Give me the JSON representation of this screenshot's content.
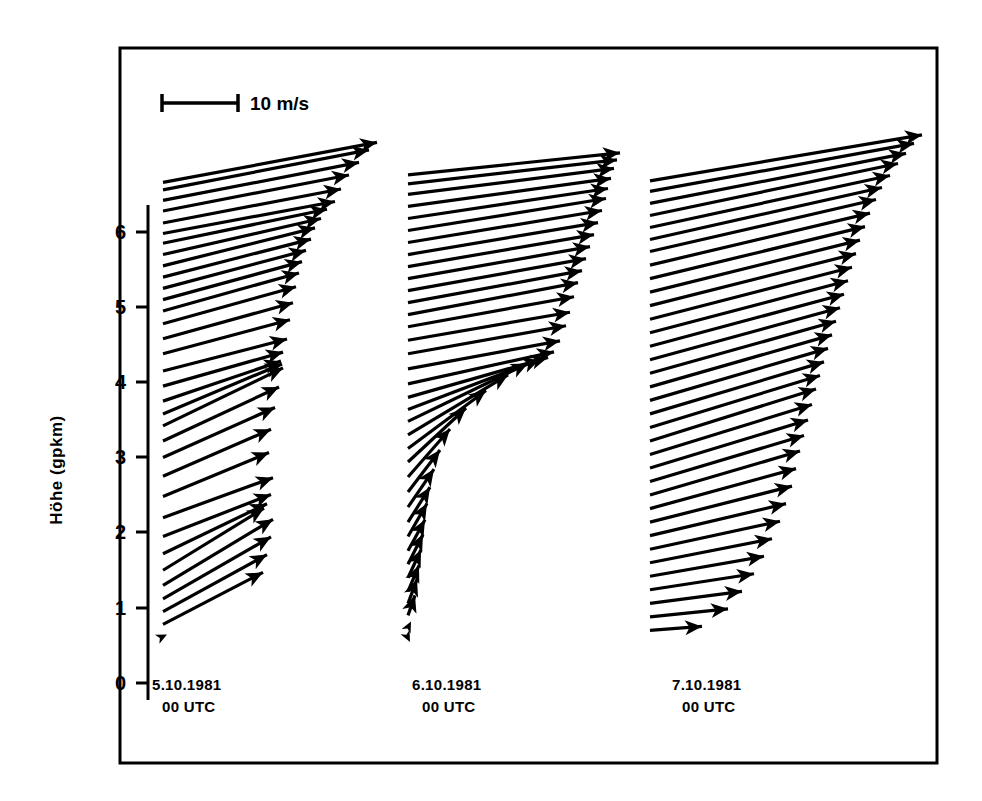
{
  "figure": {
    "background_color": "#ffffff",
    "ink_color": "#000000",
    "frame": {
      "x": 120,
      "y": 48,
      "width": 817,
      "height": 715
    }
  },
  "scale_bar": {
    "label": "10 m/s",
    "value": 10,
    "unit": "m/s",
    "pixel_length": 76,
    "x": 162,
    "y": 103,
    "label_x": 250,
    "label_y": 110
  },
  "axis": {
    "title": "Höhe (gpkm)",
    "title_x": 62,
    "title_y": 470,
    "unit": "gpkm",
    "line_x": 148,
    "y_top_px": 205,
    "y_bottom_px": 700,
    "tick_values": [
      6,
      5,
      4,
      3,
      2,
      1,
      0
    ],
    "tick_pixels": [
      232,
      307,
      382,
      457,
      532,
      608,
      683
    ],
    "tick_length": 12,
    "km_per_pixel": 0.0133,
    "ylim": [
      0,
      6.8
    ]
  },
  "chart_data": {
    "type": "line",
    "xlabel": "",
    "ylabel": "Höhe (gpkm)",
    "ylim": [
      0,
      6.8
    ],
    "grid": false,
    "legend": "none",
    "series": [
      {
        "name": "5.10.1981 00 UTC",
        "label_line1": "5.10.1981",
        "label_line2": "00 UTC",
        "label_x": 152,
        "label_y": 690,
        "baseline_x": 163,
        "arrows": [
          {
            "h": 0.62,
            "dx": 4,
            "dy": -2
          },
          {
            "h": 0.78,
            "dx": 100,
            "dy": -52
          },
          {
            "h": 0.95,
            "dx": 104,
            "dy": -57
          },
          {
            "h": 1.12,
            "dx": 108,
            "dy": -62
          },
          {
            "h": 1.3,
            "dx": 110,
            "dy": -66
          },
          {
            "h": 1.5,
            "dx": 101,
            "dy": -62
          },
          {
            "h": 1.72,
            "dx": 104,
            "dy": -50
          },
          {
            "h": 1.95,
            "dx": 108,
            "dy": -42
          },
          {
            "h": 2.2,
            "dx": 110,
            "dy": -40
          },
          {
            "h": 2.48,
            "dx": 106,
            "dy": -44
          },
          {
            "h": 2.75,
            "dx": 108,
            "dy": -47
          },
          {
            "h": 3.0,
            "dx": 112,
            "dy": -50
          },
          {
            "h": 3.22,
            "dx": 116,
            "dy": -54
          },
          {
            "h": 3.42,
            "dx": 120,
            "dy": -58
          },
          {
            "h": 3.58,
            "dx": 119,
            "dy": -50
          },
          {
            "h": 3.75,
            "dx": 118,
            "dy": -40
          },
          {
            "h": 3.95,
            "dx": 120,
            "dy": -34
          },
          {
            "h": 4.15,
            "dx": 124,
            "dy": -32
          },
          {
            "h": 4.38,
            "dx": 127,
            "dy": -34
          },
          {
            "h": 4.58,
            "dx": 130,
            "dy": -36
          },
          {
            "h": 4.78,
            "dx": 133,
            "dy": -37
          },
          {
            "h": 4.95,
            "dx": 136,
            "dy": -38
          },
          {
            "h": 5.1,
            "dx": 139,
            "dy": -38
          },
          {
            "h": 5.25,
            "dx": 143,
            "dy": -38
          },
          {
            "h": 5.4,
            "dx": 148,
            "dy": -38
          },
          {
            "h": 5.55,
            "dx": 152,
            "dy": -38
          },
          {
            "h": 5.7,
            "dx": 158,
            "dy": -36
          },
          {
            "h": 5.85,
            "dx": 164,
            "dy": -34
          },
          {
            "h": 5.98,
            "dx": 172,
            "dy": -32
          },
          {
            "h": 6.12,
            "dx": 178,
            "dy": -34
          },
          {
            "h": 6.28,
            "dx": 186,
            "dy": -36
          },
          {
            "h": 6.42,
            "dx": 196,
            "dy": -38
          },
          {
            "h": 6.56,
            "dx": 206,
            "dy": -40
          },
          {
            "h": 6.66,
            "dx": 214,
            "dy": -40
          }
        ]
      },
      {
        "name": "6.10.1981 00 UTC",
        "label_line1": "6.10.1981",
        "label_line2": "00 UTC",
        "label_x": 412,
        "label_y": 690,
        "baseline_x": 408,
        "arrows": [
          {
            "h": 0.6,
            "dx": 2,
            "dy": 4
          },
          {
            "h": 0.74,
            "dx": 3,
            "dy": -6
          },
          {
            "h": 0.9,
            "dx": 7,
            "dy": -20
          },
          {
            "h": 1.06,
            "dx": 9,
            "dy": -24
          },
          {
            "h": 1.22,
            "dx": 11,
            "dy": -26
          },
          {
            "h": 1.4,
            "dx": 13,
            "dy": -28
          },
          {
            "h": 1.58,
            "dx": 15,
            "dy": -30
          },
          {
            "h": 1.76,
            "dx": 17,
            "dy": -31
          },
          {
            "h": 1.95,
            "dx": 19,
            "dy": -33
          },
          {
            "h": 2.14,
            "dx": 22,
            "dy": -35
          },
          {
            "h": 2.34,
            "dx": 26,
            "dy": -38
          },
          {
            "h": 2.54,
            "dx": 32,
            "dy": -42
          },
          {
            "h": 2.74,
            "dx": 42,
            "dy": -48
          },
          {
            "h": 2.94,
            "dx": 58,
            "dy": -54
          },
          {
            "h": 3.12,
            "dx": 78,
            "dy": -58
          },
          {
            "h": 3.3,
            "dx": 100,
            "dy": -60
          },
          {
            "h": 3.48,
            "dx": 120,
            "dy": -58
          },
          {
            "h": 3.64,
            "dx": 132,
            "dy": -50
          },
          {
            "h": 3.8,
            "dx": 140,
            "dy": -40
          },
          {
            "h": 3.98,
            "dx": 146,
            "dy": -32
          },
          {
            "h": 4.18,
            "dx": 152,
            "dy": -28
          },
          {
            "h": 4.38,
            "dx": 158,
            "dy": -28
          },
          {
            "h": 4.56,
            "dx": 162,
            "dy": -28
          },
          {
            "h": 4.74,
            "dx": 166,
            "dy": -30
          },
          {
            "h": 4.9,
            "dx": 170,
            "dy": -32
          },
          {
            "h": 5.06,
            "dx": 174,
            "dy": -32
          },
          {
            "h": 5.22,
            "dx": 178,
            "dy": -32
          },
          {
            "h": 5.38,
            "dx": 182,
            "dy": -32
          },
          {
            "h": 5.54,
            "dx": 186,
            "dy": -32
          },
          {
            "h": 5.7,
            "dx": 190,
            "dy": -32
          },
          {
            "h": 5.86,
            "dx": 194,
            "dy": -32
          },
          {
            "h": 6.02,
            "dx": 198,
            "dy": -32
          },
          {
            "h": 6.18,
            "dx": 200,
            "dy": -30
          },
          {
            "h": 6.34,
            "dx": 203,
            "dy": -28
          },
          {
            "h": 6.5,
            "dx": 206,
            "dy": -26
          },
          {
            "h": 6.64,
            "dx": 209,
            "dy": -24
          },
          {
            "h": 6.76,
            "dx": 212,
            "dy": -22
          }
        ]
      },
      {
        "name": "7.10.1981 00 UTC",
        "label_line1": "7.10.1981",
        "label_line2": "00 UTC",
        "label_x": 672,
        "label_y": 690,
        "baseline_x": 650,
        "arrows": [
          {
            "h": 0.7,
            "dx": 52,
            "dy": -4
          },
          {
            "h": 0.88,
            "dx": 78,
            "dy": -8
          },
          {
            "h": 1.06,
            "dx": 92,
            "dy": -12
          },
          {
            "h": 1.24,
            "dx": 104,
            "dy": -16
          },
          {
            "h": 1.42,
            "dx": 114,
            "dy": -20
          },
          {
            "h": 1.6,
            "dx": 122,
            "dy": -24
          },
          {
            "h": 1.78,
            "dx": 130,
            "dy": -28
          },
          {
            "h": 1.96,
            "dx": 136,
            "dy": -32
          },
          {
            "h": 2.14,
            "dx": 142,
            "dy": -36
          },
          {
            "h": 2.32,
            "dx": 146,
            "dy": -40
          },
          {
            "h": 2.5,
            "dx": 150,
            "dy": -44
          },
          {
            "h": 2.68,
            "dx": 154,
            "dy": -46
          },
          {
            "h": 2.86,
            "dx": 158,
            "dy": -48
          },
          {
            "h": 3.04,
            "dx": 162,
            "dy": -50
          },
          {
            "h": 3.22,
            "dx": 166,
            "dy": -52
          },
          {
            "h": 3.4,
            "dx": 170,
            "dy": -52
          },
          {
            "h": 3.58,
            "dx": 174,
            "dy": -52
          },
          {
            "h": 3.76,
            "dx": 178,
            "dy": -52
          },
          {
            "h": 3.94,
            "dx": 182,
            "dy": -52
          },
          {
            "h": 4.12,
            "dx": 186,
            "dy": -52
          },
          {
            "h": 4.3,
            "dx": 190,
            "dy": -52
          },
          {
            "h": 4.48,
            "dx": 194,
            "dy": -52
          },
          {
            "h": 4.66,
            "dx": 198,
            "dy": -52
          },
          {
            "h": 4.84,
            "dx": 202,
            "dy": -52
          },
          {
            "h": 5.02,
            "dx": 206,
            "dy": -52
          },
          {
            "h": 5.2,
            "dx": 210,
            "dy": -52
          },
          {
            "h": 5.38,
            "dx": 215,
            "dy": -52
          },
          {
            "h": 5.56,
            "dx": 220,
            "dy": -52
          },
          {
            "h": 5.74,
            "dx": 226,
            "dy": -52
          },
          {
            "h": 5.9,
            "dx": 232,
            "dy": -52
          },
          {
            "h": 6.06,
            "dx": 240,
            "dy": -52
          },
          {
            "h": 6.22,
            "dx": 248,
            "dy": -52
          },
          {
            "h": 6.38,
            "dx": 256,
            "dy": -50
          },
          {
            "h": 6.54,
            "dx": 264,
            "dy": -48
          },
          {
            "h": 6.68,
            "dx": 272,
            "dy": -46
          }
        ]
      }
    ]
  }
}
